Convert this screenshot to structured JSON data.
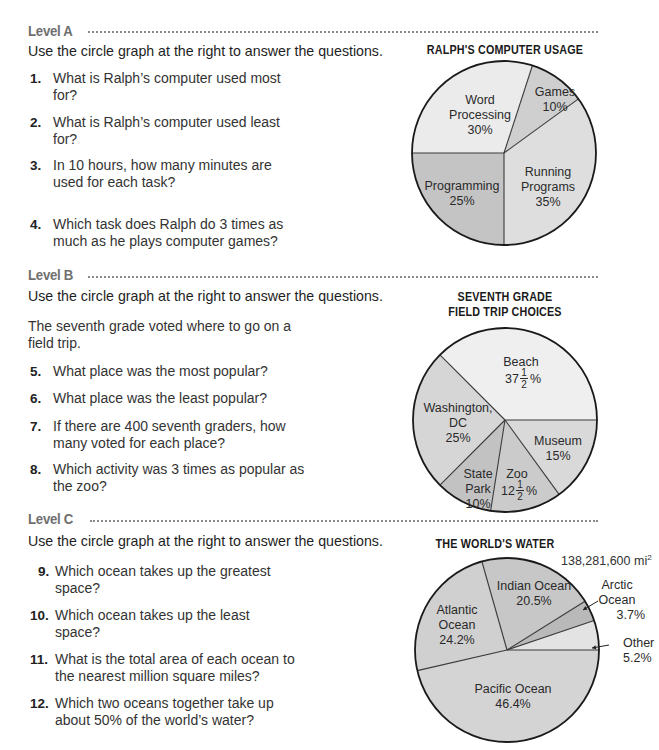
{
  "levels": [
    {
      "heading": "Level A",
      "instruction": "Use the circle graph at the right to answer the questions.",
      "questions": [
        {
          "num": "1.",
          "text": "What is Ralph’s computer used most for?"
        },
        {
          "num": "2.",
          "text": "What is Ralph’s computer used least for?"
        },
        {
          "num": "3.",
          "text": "In 10 hours, how many minutes are used for each task?"
        },
        {
          "num": "4.",
          "text": "Which task does Ralph do 3 times as much as he plays computer games?"
        }
      ]
    },
    {
      "heading": "Level B",
      "instruction": "Use the circle graph at the right to answer the questions.",
      "intro": "The seventh grade voted where to go on a field trip.",
      "questions": [
        {
          "num": "5.",
          "text": "What place was the most popular?"
        },
        {
          "num": "6.",
          "text": "What place was the least popular?"
        },
        {
          "num": "7.",
          "text": "If there are 400 seventh graders, how many voted for each place?"
        },
        {
          "num": "8.",
          "text": "Which activity was 3 times as popular as the zoo?"
        }
      ]
    },
    {
      "heading": "Level C",
      "instruction": "Use the circle graph at the right to answer the questions.",
      "questions": [
        {
          "num": "9.",
          "text": "Which ocean takes up the greatest space?"
        },
        {
          "num": "10.",
          "text": "Which ocean takes up the least space?"
        },
        {
          "num": "11.",
          "text": "What is the total area of each ocean to the nearest million square miles?"
        },
        {
          "num": "12.",
          "text": "Which two oceans together take up about 50% of the world’s water?"
        }
      ]
    }
  ],
  "chart_data": [
    {
      "type": "pie",
      "title": "RALPH'S COMPUTER USAGE",
      "categories": [
        "Word Processing",
        "Games",
        "Running Programs",
        "Programming"
      ],
      "values": [
        30,
        10,
        35,
        25
      ],
      "labels": [
        {
          "lines": [
            "Word",
            "Processing",
            "30%"
          ]
        },
        {
          "lines": [
            "Games",
            "10%"
          ]
        },
        {
          "lines": [
            "Running",
            "Programs",
            "35%"
          ]
        },
        {
          "lines": [
            "Programming",
            "25%"
          ]
        }
      ],
      "colors": [
        "#ebebeb",
        "#cfcfcf",
        "#dedede",
        "#c4c4c4"
      ],
      "unit": "%"
    },
    {
      "type": "pie",
      "title": "SEVENTH GRADE FIELD TRIP CHOICES",
      "title_lines": [
        "SEVENTH GRADE",
        "FIELD TRIP CHOICES"
      ],
      "categories": [
        "Beach",
        "Washington, DC",
        "State Park",
        "Zoo",
        "Museum"
      ],
      "values": [
        37.5,
        25,
        10,
        12.5,
        15
      ],
      "labels": [
        {
          "lines": [
            "Beach"
          ],
          "whole": "37",
          "frac_num": "1",
          "frac_den": "2",
          "suffix": "%"
        },
        {
          "lines": [
            "Washington,",
            "DC",
            "25%"
          ]
        },
        {
          "lines": [
            "State",
            "Park",
            "10%"
          ]
        },
        {
          "lines": [
            "Zoo"
          ],
          "whole": "12",
          "frac_num": "1",
          "frac_den": "2",
          "suffix": "%"
        },
        {
          "lines": [
            "Museum",
            "15%"
          ]
        }
      ],
      "colors": [
        "#efefef",
        "#d6d6d6",
        "#c2c2c2",
        "#cbcbcb",
        "#d9d9d9"
      ],
      "unit": "%"
    },
    {
      "type": "pie",
      "title": "THE WORLD'S WATER",
      "total_label": "138,281,600 mi",
      "total_sup": "2",
      "categories": [
        "Pacific Ocean",
        "Atlantic Ocean",
        "Indian Ocean",
        "Arctic Ocean",
        "Other"
      ],
      "values": [
        46.4,
        24.2,
        20.5,
        3.7,
        5.2
      ],
      "labels": [
        {
          "lines": [
            "Pacific Ocean",
            "46.4%"
          ]
        },
        {
          "lines": [
            "Atlantic",
            "Ocean",
            "24.2%"
          ]
        },
        {
          "lines": [
            "Indian Ocean",
            "20.5%"
          ]
        },
        {
          "lines": [
            "Arctic",
            "Ocean",
            "3.7%"
          ]
        },
        {
          "lines": [
            "Other",
            "5.2%"
          ]
        }
      ],
      "colors": [
        "#d4d4d4",
        "#d0d0d0",
        "#c7c7c7",
        "#b9b9b9",
        "#e3e3e3"
      ],
      "unit": "%"
    }
  ]
}
